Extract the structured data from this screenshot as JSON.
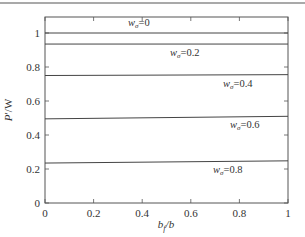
{
  "chart_data": {
    "type": "line",
    "title": "",
    "xlabel": "b_f/b",
    "ylabel": "P'/W",
    "xlim": [
      0,
      1
    ],
    "ylim": [
      0,
      1.1
    ],
    "grid": false,
    "legend_position": "inline labels",
    "x_ticks": [
      "0",
      "0.2",
      "0.4",
      "0.6",
      "0.8",
      "1"
    ],
    "y_ticks": [
      "0",
      "0.2",
      "0.4",
      "0.6",
      "0.8",
      "1"
    ],
    "x": [
      0,
      1
    ],
    "series": [
      {
        "name": "w_σ=0",
        "label_main": "w",
        "label_sub": "σ",
        "label_value": "=0",
        "values": [
          1.0,
          1.0
        ]
      },
      {
        "name": "w_σ=0.2",
        "label_main": "w",
        "label_sub": "σ",
        "label_value": "=0.2",
        "values": [
          0.935,
          0.935
        ]
      },
      {
        "name": "w_σ=0.4",
        "label_main": "w",
        "label_sub": "σ",
        "label_value": "=0.4",
        "values": [
          0.75,
          0.755
        ]
      },
      {
        "name": "w_σ=0.6",
        "label_main": "w",
        "label_sub": "σ",
        "label_value": "=0.6",
        "values": [
          0.495,
          0.51
        ]
      },
      {
        "name": "w_σ=0.8",
        "label_main": "w",
        "label_sub": "σ",
        "label_value": "=0.8",
        "values": [
          0.235,
          0.248
        ]
      }
    ]
  },
  "axes": {
    "xlabel_main": "b",
    "xlabel_sub": "f",
    "xlabel_rest": "/b",
    "ylabel_main": "P",
    "ylabel_rest": "′/W"
  }
}
